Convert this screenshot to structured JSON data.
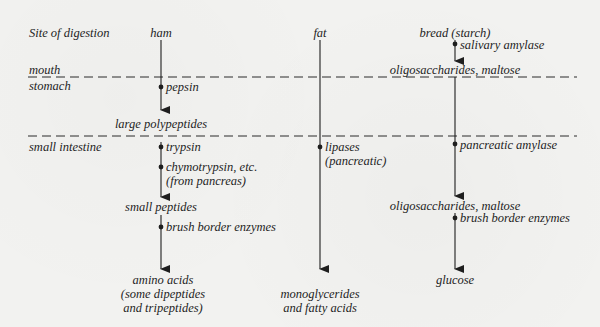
{
  "site_header": "Site of digestion",
  "regions": {
    "mouth": "mouth",
    "stomach": "stomach",
    "small_intestine": "small intestine"
  },
  "columns": {
    "ham": {
      "food": "ham",
      "stomach_enzyme": "pepsin",
      "stomach_product": "large polypeptides",
      "intestine_enzyme_1": "trypsin",
      "intestine_enzyme_2_line1": "chymotrypsin, etc.",
      "intestine_enzyme_2_line2": "(from pancreas)",
      "intestine_product": "small peptides",
      "final_enzyme": "brush border enzymes",
      "final_product_line1": "amino acids",
      "final_product_line2": "(some dipeptides",
      "final_product_line3": "and tripeptides)"
    },
    "fat": {
      "food": "fat",
      "intestine_enzyme_line1": "lipases",
      "intestine_enzyme_line2": "(pancreatic)",
      "final_product_line1": "monoglycerides",
      "final_product_line2": "and fatty acids"
    },
    "bread": {
      "food": "bread (starch)",
      "mouth_enzyme": "salivary amylase",
      "mouth_product": "oligosaccharides, maltose",
      "intestine_enzyme": "pancreatic amylase",
      "intestine_product": "oligosaccharides, maltose",
      "final_enzyme": "brush border enzymes",
      "final_product": "glucose"
    }
  },
  "colors": {
    "ink": "#1e1e1e",
    "paper": "#f2f2f0"
  }
}
